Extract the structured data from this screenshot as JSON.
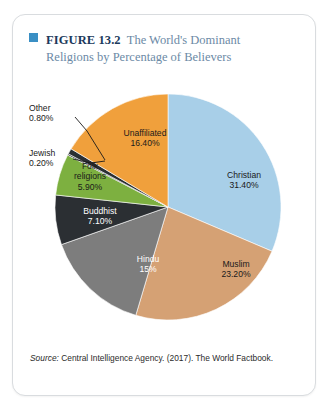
{
  "figure": {
    "bullet_color": "#3a8fc4",
    "label": "FIGURE 13.2",
    "title_line1": "The World's Dominant",
    "title_line2": "Religions by Percentage of Believers",
    "source_prefix": "Source:",
    "source_text": " Central Intelligence Agency. (2017). The World Factbook."
  },
  "chart_data": {
    "type": "pie",
    "title": "The World's Dominant Religions by Percentage of Believers",
    "unit": "%",
    "start_angle": 0,
    "direction": "clockwise",
    "legend": "none",
    "labels_inside": true,
    "categories": [
      "Christian",
      "Muslim",
      "Hindu",
      "Buddhist",
      "Folk religions",
      "Jewish",
      "Other",
      "Unaffiliated"
    ],
    "values": [
      31.4,
      23.2,
      15,
      7.1,
      5.9,
      0.2,
      0.8,
      16.4
    ],
    "colors": [
      "#a8cfe8",
      "#d5a174",
      "#7d7d7d",
      "#2b2f33",
      "#7db040",
      "#2b2f33",
      "#2b2f33",
      "#f0a03c"
    ],
    "slices": [
      {
        "name": "Christian",
        "label": "Christian",
        "value_label": "31.40%",
        "value": 31.4,
        "color": "#a8cfe8",
        "text_color": "#1a1a1a",
        "placement": "inside"
      },
      {
        "name": "Muslim",
        "label": "Muslim",
        "value_label": "23.20%",
        "value": 23.2,
        "color": "#d5a174",
        "text_color": "#1a1a1a",
        "placement": "inside"
      },
      {
        "name": "Hindu",
        "label": "Hindu",
        "value_label": "15%",
        "value": 15,
        "color": "#7d7d7d",
        "text_color": "#ffffff",
        "placement": "inside"
      },
      {
        "name": "Buddhist",
        "label": "Buddhist",
        "value_label": "7.10%",
        "value": 7.1,
        "color": "#2b2f33",
        "text_color": "#ffffff",
        "placement": "inside"
      },
      {
        "name": "Folk religions",
        "label_line1": "Folk",
        "label_line2": "religions",
        "value_label": "5.90%",
        "value": 5.9,
        "color": "#7db040",
        "text_color": "#1a1a1a",
        "placement": "inside"
      },
      {
        "name": "Jewish",
        "label": "Jewish",
        "value_label": "0.20%",
        "value": 0.2,
        "color": "#2b2f33",
        "text_color": "#1a1a1a",
        "placement": "outside"
      },
      {
        "name": "Other",
        "label": "Other",
        "value_label": "0.80%",
        "value": 0.8,
        "color": "#2b2f33",
        "text_color": "#1a1a1a",
        "placement": "outside"
      },
      {
        "name": "Unaffiliated",
        "label": "Unaffiliated",
        "value_label": "16.40%",
        "value": 16.4,
        "color": "#f0a03c",
        "text_color": "#1a1a1a",
        "placement": "inside"
      }
    ]
  }
}
